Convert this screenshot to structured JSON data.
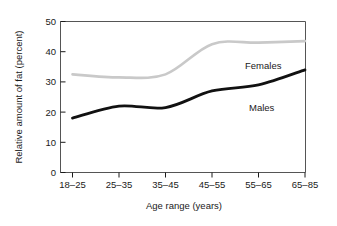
{
  "chart_data": {
    "type": "line",
    "title": "",
    "xlabel": "Age range (years)",
    "ylabel": "Relative amount of fat (percent)",
    "categories": [
      "18–25",
      "25–35",
      "35–45",
      "45–55",
      "55–65",
      "65–85"
    ],
    "yticks": [
      "0",
      "10",
      "20",
      "30",
      "40",
      "50"
    ],
    "ylim": [
      0,
      50
    ],
    "grid": false,
    "legend_position": "inline-annotation",
    "series": [
      {
        "name": "Females",
        "color": "#c9c9c9",
        "values": [
          32.5,
          31.5,
          32.5,
          42.5,
          43.0,
          43.5
        ],
        "label": "Females"
      },
      {
        "name": "Males",
        "color": "#111111",
        "values": [
          18.0,
          22.0,
          21.5,
          27.0,
          29.0,
          34.0
        ],
        "label": "Males"
      }
    ],
    "annotations": [
      {
        "text": "Females",
        "x": 245,
        "y": 66
      },
      {
        "text": "Males",
        "x": 249,
        "y": 108
      }
    ]
  },
  "axes": {
    "x_title": "Age range (years)",
    "y_title": "Relative amount of fat (percent)"
  },
  "colors": {
    "females_line": "#c9c9c9",
    "males_line": "#111111",
    "frame": "#555555",
    "text": "#1a1a1a",
    "background": "#ffffff"
  }
}
